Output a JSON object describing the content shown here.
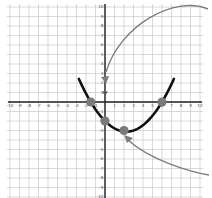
{
  "chart_data": {
    "type": "line",
    "title": "",
    "xlabel": "",
    "ylabel": "",
    "xlim": [
      -10,
      10
    ],
    "ylim": [
      -10,
      10
    ],
    "grid": true,
    "x_ticks": [
      -10,
      -9,
      -8,
      -7,
      -6,
      -5,
      -4,
      -3,
      -2,
      -1,
      1,
      2,
      3,
      4,
      5,
      6,
      7,
      8,
      9,
      10
    ],
    "y_ticks": [
      -10,
      -9,
      -8,
      -7,
      -6,
      -5,
      -4,
      -3,
      -2,
      -1,
      1,
      2,
      3,
      4,
      5,
      6,
      7,
      8,
      9,
      10
    ],
    "series": [
      {
        "name": "parabola",
        "kind": "curve",
        "color": "#111111",
        "equation_approx": "y = 0.222(x + 1.5)(x - 6)",
        "x": [
          -2.6,
          -1.5,
          0,
          1,
          2,
          2.25,
          3,
          4,
          5,
          6,
          7.3
        ],
        "y": [
          10,
          0,
          -2,
          -2.7,
          -3.1,
          -3.1,
          -3.0,
          -2.4,
          -1.5,
          0,
          10
        ]
      }
    ],
    "highlighted_points": [
      {
        "x": -1.5,
        "y": 0,
        "label": "x-intercept"
      },
      {
        "x": 0,
        "y": -2,
        "label": "y-intercept"
      },
      {
        "x": 2,
        "y": -3,
        "label": "vertex"
      },
      {
        "x": 6,
        "y": 0,
        "label": "x-intercept"
      }
    ],
    "point_color": "#7a7a7a",
    "annotations": [
      {
        "type": "arrow",
        "description": "curved gray arrow from top-right pointing to y-axis near (0, 1)",
        "color": "#777777"
      },
      {
        "type": "arrow",
        "description": "curved gray arrow from bottom-right pointing to vertex near (2, -3)",
        "color": "#777777"
      }
    ]
  },
  "colors": {
    "grid": "#c8c8c8",
    "axis": "#222222",
    "curve": "#111111",
    "points": "#7a7a7a",
    "arrows": "#7d7d7d"
  }
}
